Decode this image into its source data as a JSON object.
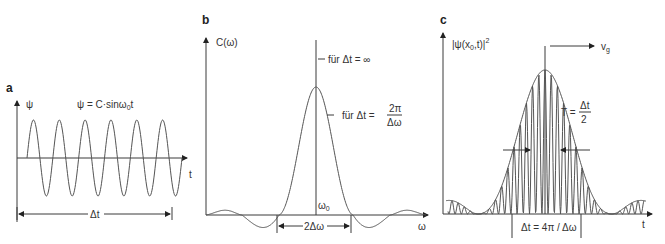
{
  "panels": {
    "a": {
      "label": "a",
      "y_label": "ψ",
      "formula": "ψ = C·sinω",
      "formula_sub": "0",
      "formula_end": "t",
      "x_label": "t",
      "span_label": "Δt",
      "cycles": 6
    },
    "b": {
      "label": "b",
      "y_label": "C(ω)",
      "x_label": "ω",
      "center_label": "ω",
      "center_sub": "0",
      "annotation_inf": "für   Δt = ∞",
      "annotation_finite_prefix": "für   Δt =",
      "annotation_finite_num": "2π",
      "annotation_finite_den": "Δω",
      "width_label": "2Δω"
    },
    "c": {
      "label": "c",
      "y_label": "|ψ(x",
      "y_label_sub": "0",
      "y_label_end": ",t)|",
      "y_label_sup": "2",
      "x_label": "t",
      "velocity_label": "v",
      "velocity_sub": "g",
      "period_prefix": "T =",
      "period_num": "Δt",
      "period_den": "2",
      "span_label": "Δt = 4π / Δω"
    }
  },
  "colors": {
    "line": "#3a3a3a",
    "curve": "#555555",
    "text": "#333333"
  }
}
